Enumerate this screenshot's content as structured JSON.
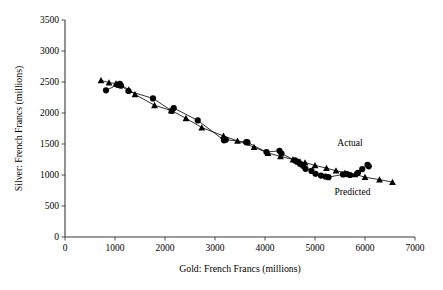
{
  "chart_data": {
    "type": "scatter",
    "title": "",
    "xlabel": "Gold: French Francs (millions)",
    "ylabel": "Silver: French Francs (millions)",
    "xlim": [
      0,
      7000
    ],
    "ylim": [
      0,
      3500
    ],
    "xticks": [
      0,
      1000,
      2000,
      3000,
      4000,
      5000,
      6000,
      7000
    ],
    "yticks": [
      0,
      500,
      1000,
      1500,
      2000,
      2500,
      3000,
      3500
    ],
    "grid": false,
    "legend_position": "inline-annotations",
    "annotations": [
      {
        "text": "Actual",
        "x": 5700,
        "y": 1470
      },
      {
        "text": "Predicted",
        "x": 5750,
        "y": 680
      }
    ],
    "series": [
      {
        "name": "Actual",
        "marker": "circle",
        "connected": true,
        "color": "#000000",
        "points": [
          [
            820,
            2365
          ],
          [
            1050,
            2455
          ],
          [
            1095,
            2470
          ],
          [
            1120,
            2440
          ],
          [
            1270,
            2355
          ],
          [
            1760,
            2235
          ],
          [
            2135,
            2035
          ],
          [
            2175,
            2080
          ],
          [
            2655,
            1880
          ],
          [
            3180,
            1560
          ],
          [
            3215,
            1570
          ],
          [
            3625,
            1530
          ],
          [
            3650,
            1525
          ],
          [
            4030,
            1370
          ],
          [
            4290,
            1390
          ],
          [
            4330,
            1345
          ],
          [
            4600,
            1235
          ],
          [
            4640,
            1215
          ],
          [
            4700,
            1180
          ],
          [
            4760,
            1150
          ],
          [
            4810,
            1100
          ],
          [
            4930,
            1065
          ],
          [
            5010,
            1020
          ],
          [
            5120,
            990
          ],
          [
            5210,
            975
          ],
          [
            5270,
            965
          ],
          [
            5560,
            1010
          ],
          [
            5640,
            1015
          ],
          [
            5700,
            1000
          ],
          [
            5860,
            1035
          ],
          [
            5945,
            1095
          ],
          [
            6050,
            1165
          ],
          [
            6075,
            1140
          ]
        ]
      },
      {
        "name": "Predicted",
        "marker": "triangle",
        "connected": true,
        "color": "#000000",
        "points": [
          [
            720,
            2525
          ],
          [
            880,
            2490
          ],
          [
            1020,
            2475
          ],
          [
            1100,
            2465
          ],
          [
            1275,
            2375
          ],
          [
            1400,
            2300
          ],
          [
            1790,
            2125
          ],
          [
            2125,
            2040
          ],
          [
            2420,
            1915
          ],
          [
            2735,
            1765
          ],
          [
            3170,
            1630
          ],
          [
            3450,
            1550
          ],
          [
            3780,
            1450
          ],
          [
            4060,
            1355
          ],
          [
            4310,
            1300
          ],
          [
            4560,
            1250
          ],
          [
            4700,
            1215
          ],
          [
            4800,
            1200
          ],
          [
            5000,
            1155
          ],
          [
            5230,
            1110
          ],
          [
            5420,
            1070
          ],
          [
            5600,
            1035
          ],
          [
            5800,
            1010
          ],
          [
            6000,
            965
          ],
          [
            6290,
            925
          ],
          [
            6550,
            885
          ]
        ]
      }
    ]
  }
}
